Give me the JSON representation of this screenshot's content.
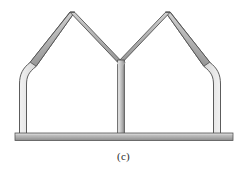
{
  "figure": {
    "caption": "(c)",
    "kind": "structural-frame-diagram",
    "colors": {
      "background": "#ffffff",
      "member_light": "#e8e8e8",
      "member_mid": "#b4b4b4",
      "member_dark": "#8a8a8a",
      "outline": "#4a4a4a",
      "beam_light": "#c9c9c9",
      "beam_mid": "#a8a8a8",
      "beam_dark": "#7c7c7c",
      "caption_text": "#2b2b2b"
    },
    "geometry": {
      "member_thickness": 7,
      "beam": {
        "x": 15,
        "y": 133,
        "width": 218,
        "height": 7
      },
      "left_column": {
        "x": 20,
        "base_y": 133,
        "knee_y": 74
      },
      "center_column": {
        "x": 118,
        "base_y": 133,
        "junction_y": 62
      },
      "right_column": {
        "x": 220,
        "base_y": 133,
        "knee_y": 74
      },
      "left_apex": {
        "x": 72,
        "y": 12
      },
      "right_apex": {
        "x": 169,
        "y": 12
      },
      "valley": {
        "x": 120,
        "y": 62
      }
    },
    "members": [
      {
        "name": "left-outer-column",
        "label": "left column"
      },
      {
        "name": "left-knee-haunch",
        "label": "left curved knee"
      },
      {
        "name": "left-outer-rafter",
        "label": "left outer rafter"
      },
      {
        "name": "left-inner-rafter",
        "label": "left inner rafter"
      },
      {
        "name": "center-column",
        "label": "centre column"
      },
      {
        "name": "right-inner-rafter",
        "label": "right inner rafter"
      },
      {
        "name": "right-outer-rafter",
        "label": "right outer rafter"
      },
      {
        "name": "right-knee-haunch",
        "label": "right curved knee"
      },
      {
        "name": "right-outer-column",
        "label": "right column"
      },
      {
        "name": "ground-beam",
        "label": "ground beam"
      }
    ]
  }
}
